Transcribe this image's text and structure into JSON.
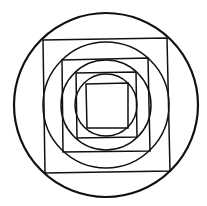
{
  "diagram": {
    "title": "",
    "stroke_color": "#111111",
    "background": "#ffffff",
    "center": [
      106,
      105
    ],
    "circles": [
      {
        "r": 92,
        "stroke_width": 2.2
      },
      {
        "r": 63,
        "stroke_width": 1.5
      },
      {
        "r": 45,
        "stroke_width": 1.5
      },
      {
        "r": 31,
        "stroke_width": 1.5
      }
    ],
    "squares": [
      {
        "points": "43,40 167,38 170,171 45,173",
        "stroke_width": 1.5
      },
      {
        "points": "62,60 148,58 150,151 63,152",
        "stroke_width": 1.5
      },
      {
        "points": "76,73 136,72 137,137 77,138",
        "stroke_width": 1.5
      },
      {
        "points": "86,84 128,83 128,128 87,128",
        "stroke_width": 1.5
      }
    ]
  }
}
